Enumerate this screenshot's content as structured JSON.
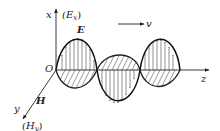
{
  "diagram": {
    "labels": {
      "origin": "O",
      "x_axis": "x",
      "x_field": "(E",
      "x_sub": "x",
      "y_axis": "y",
      "y_field": "(H",
      "y_sub": "y",
      "z_axis": "z",
      "e_wave": "E",
      "h_wave": "H",
      "velocity": "v",
      "close_paren": ")"
    },
    "colors": {
      "stroke": "#222222",
      "background": "#ffffff"
    }
  }
}
